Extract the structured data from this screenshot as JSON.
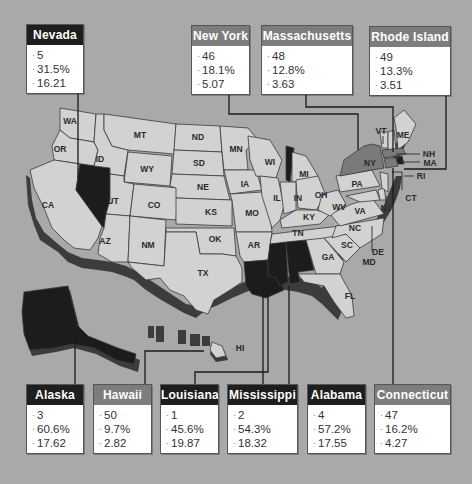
{
  "map": {
    "title": "",
    "legend_colors": {
      "high": "#1c1c1c",
      "low": "#7a7a7a",
      "neutral": "#d2d2d2",
      "background": "#a9a9a9"
    },
    "state_labels": [
      "WA",
      "OR",
      "CA",
      "ID",
      "MT",
      "WY",
      "UT",
      "CO",
      "AZ",
      "NM",
      "ND",
      "SD",
      "NE",
      "KS",
      "OK",
      "TX",
      "MN",
      "IA",
      "MO",
      "AR",
      "WI",
      "IL",
      "MI",
      "IN",
      "OH",
      "KY",
      "TN",
      "PA",
      "WV",
      "VA",
      "NC",
      "SC",
      "GA",
      "FL",
      "NY",
      "VT",
      "ME",
      "NH",
      "MA",
      "RI",
      "CT",
      "NJ",
      "DE",
      "MD",
      "HI"
    ]
  },
  "callouts": {
    "nevada": {
      "name": "Nevada",
      "rank": "5",
      "percent": "31.5%",
      "value": "16.21",
      "tone": "dark"
    },
    "new_york": {
      "name": "New York",
      "rank": "46",
      "percent": "18.1%",
      "value": "5.07",
      "tone": "mid"
    },
    "massachusetts": {
      "name": "Massachusetts",
      "rank": "48",
      "percent": "12.8%",
      "value": "3.63",
      "tone": "mid"
    },
    "rhode_island": {
      "name": "Rhode Island",
      "rank": "49",
      "percent": "13.3%",
      "value": "3.51",
      "tone": "mid"
    },
    "alaska": {
      "name": "Alaska",
      "rank": "3",
      "percent": "60.6%",
      "value": "17.62",
      "tone": "dark"
    },
    "hawaii": {
      "name": "Hawaii",
      "rank": "50",
      "percent": "9.7%",
      "value": "2.82",
      "tone": "mid"
    },
    "louisiana": {
      "name": "Louisiana",
      "rank": "1",
      "percent": "45.6%",
      "value": "19.87",
      "tone": "dark"
    },
    "mississippi": {
      "name": "Mississippi",
      "rank": "2",
      "percent": "54.3%",
      "value": "18.32",
      "tone": "dark"
    },
    "alabama": {
      "name": "Alabama",
      "rank": "4",
      "percent": "57.2%",
      "value": "17.55",
      "tone": "dark"
    },
    "connecticut": {
      "name": "Connecticut",
      "rank": "47",
      "percent": "16.2%",
      "value": "4.27",
      "tone": "mid"
    }
  }
}
